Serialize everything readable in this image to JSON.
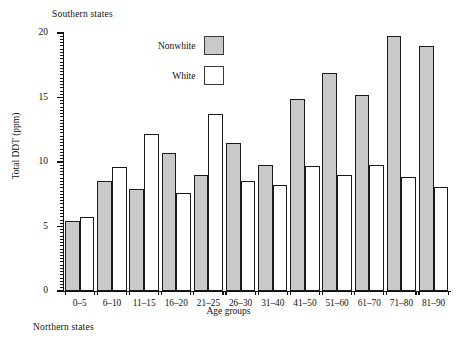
{
  "captions": {
    "top": "Southern states",
    "bottom": "Northern states"
  },
  "chart_data": {
    "type": "bar",
    "title": "Southern states",
    "xlabel": "Age groups",
    "ylabel": "Total DDT (ppm)",
    "ylim": [
      0,
      20
    ],
    "yticks": [
      0,
      5,
      10,
      15,
      20
    ],
    "ytick_labels": [
      "0",
      "5",
      "10",
      "15",
      "20"
    ],
    "grid": false,
    "legend_position": "top-center",
    "categories": [
      "0–5",
      "6–10",
      "11–15",
      "16–20",
      "21–25",
      "26–30",
      "31–40",
      "41–50",
      "51–60",
      "61–70",
      "71–80",
      "81–90"
    ],
    "series": [
      {
        "name": "Nonwhite",
        "color": "#c9c9c9",
        "values": [
          5.4,
          8.5,
          7.9,
          10.7,
          9.0,
          11.5,
          9.8,
          14.9,
          16.9,
          15.2,
          19.8,
          19.0
        ]
      },
      {
        "name": "White",
        "color": "#ffffff",
        "values": [
          5.7,
          9.6,
          12.2,
          7.6,
          13.7,
          8.5,
          8.2,
          9.7,
          9.0,
          9.8,
          8.8,
          8.1
        ]
      }
    ]
  },
  "legend": {
    "entries": [
      {
        "label": "Nonwhite",
        "swatch": "nonwhite"
      },
      {
        "label": "White",
        "swatch": "white"
      }
    ]
  }
}
